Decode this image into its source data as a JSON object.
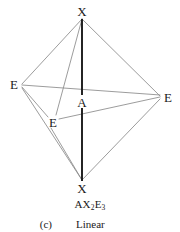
{
  "diagram": {
    "type": "vsepr-molecular-geometry",
    "shape_name": "Linear",
    "parent_geometry": "trigonal bipyramidal",
    "colors": {
      "axial_bond": "#1a1a1a",
      "edge": "#8a8a8a",
      "background": "#ffffff",
      "text": "#1a1a1a"
    },
    "vertices": [
      {
        "id": "x-top",
        "label": "X",
        "x": 82,
        "y": 11,
        "role": "axial-atom"
      },
      {
        "id": "x-bottom",
        "label": "X",
        "x": 82,
        "y": 188,
        "role": "axial-atom"
      },
      {
        "id": "e-left",
        "label": "E",
        "x": 14,
        "y": 84,
        "role": "lone-pair"
      },
      {
        "id": "e-right",
        "label": "E",
        "x": 168,
        "y": 97,
        "role": "lone-pair"
      },
      {
        "id": "e-lower",
        "label": "E",
        "x": 53,
        "y": 122,
        "role": "lone-pair"
      },
      {
        "id": "a-center",
        "label": "A",
        "x": 82,
        "y": 102,
        "role": "central-atom"
      }
    ],
    "formula": {
      "central": "A",
      "ligand": "X",
      "ligand_count": "2",
      "lone_pair": "E",
      "lone_pair_count": "3",
      "text": "AX2E3"
    },
    "caption": {
      "index": "(c)",
      "name": "Linear"
    }
  }
}
